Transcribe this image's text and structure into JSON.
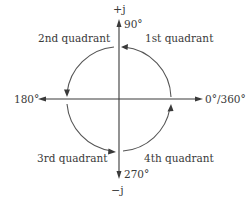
{
  "figure": {
    "axes": {
      "positive_imag_label": "+j",
      "negative_imag_label": "−j",
      "angle_0_label": "0°/360°",
      "angle_90_label": "90°",
      "angle_180_label": "180°",
      "angle_270_label": "270°"
    },
    "quadrants": [
      {
        "label": "1st quadrant"
      },
      {
        "label": "2nd quadrant"
      },
      {
        "label": "3rd quadrant"
      },
      {
        "label": "4th quadrant"
      }
    ],
    "colors": {
      "line": "#3a3a3a",
      "arc": "#555555",
      "background": "#ffffff"
    }
  }
}
